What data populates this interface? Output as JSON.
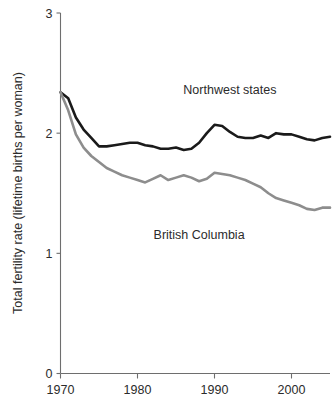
{
  "chart_data": {
    "type": "line",
    "title": "",
    "xlabel": "",
    "ylabel": "Total fertility rate (lifetime births per woman)",
    "xlim": [
      1970,
      2005
    ],
    "ylim": [
      0,
      3
    ],
    "grid": false,
    "legend_position": "inline-annotations",
    "xticks": [
      1970,
      1980,
      1990,
      2000
    ],
    "xtick_labels": [
      "1970",
      "1980",
      "1990",
      "2000"
    ],
    "yticks": [
      0,
      1,
      2,
      3
    ],
    "ytick_labels": [
      "0",
      "1",
      "2",
      "3"
    ],
    "x": [
      1970,
      1971,
      1972,
      1973,
      1974,
      1975,
      1976,
      1977,
      1978,
      1979,
      1980,
      1981,
      1982,
      1983,
      1984,
      1985,
      1986,
      1987,
      1988,
      1989,
      1990,
      1991,
      1992,
      1993,
      1994,
      1995,
      1996,
      1997,
      1998,
      1999,
      2000,
      2001,
      2002,
      2003,
      2004,
      2005
    ],
    "series": [
      {
        "name": "Northwest states",
        "color": "#1a1a1a",
        "label_x": 1992,
        "label_y": 2.33,
        "values": [
          2.34,
          2.29,
          2.13,
          2.03,
          1.96,
          1.89,
          1.89,
          1.9,
          1.91,
          1.92,
          1.92,
          1.9,
          1.89,
          1.87,
          1.87,
          1.88,
          1.86,
          1.87,
          1.92,
          2.0,
          2.07,
          2.06,
          2.01,
          1.97,
          1.96,
          1.96,
          1.98,
          1.96,
          2.0,
          1.99,
          1.99,
          1.97,
          1.95,
          1.94,
          1.96,
          1.97
        ]
      },
      {
        "name": "British Columbia",
        "color": "#8d8d8d",
        "label_x": 1988,
        "label_y": 1.12,
        "values": [
          2.34,
          2.19,
          1.99,
          1.88,
          1.81,
          1.76,
          1.71,
          1.68,
          1.65,
          1.63,
          1.61,
          1.59,
          1.62,
          1.65,
          1.61,
          1.63,
          1.65,
          1.63,
          1.6,
          1.62,
          1.67,
          1.66,
          1.65,
          1.63,
          1.61,
          1.58,
          1.55,
          1.5,
          1.46,
          1.44,
          1.42,
          1.4,
          1.37,
          1.36,
          1.38,
          1.38
        ]
      }
    ]
  },
  "axis": {
    "y_title": "Total fertility rate (lifetime births per woman)",
    "y_labels": [
      "3",
      "2",
      "1",
      "0"
    ],
    "x_labels": [
      "1970",
      "1980",
      "1990",
      "2000"
    ]
  },
  "annotations": {
    "northwest": "Northwest states",
    "british_columbia": "British Columbia"
  }
}
